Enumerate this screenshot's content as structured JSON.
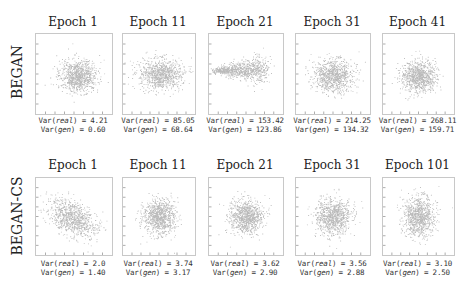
{
  "chart_data": {
    "type": "scatter",
    "title": "",
    "grid": false,
    "rows": [
      {
        "label": "BEGAN",
        "panels": [
          {
            "title": "Epoch 1",
            "var_real": "4.21",
            "var_gen": "0.60",
            "cloud": {
              "cx": 0.55,
              "cy": 0.52,
              "rx": 0.25,
              "ry": 0.2,
              "shape": "blob"
            }
          },
          {
            "title": "Epoch 11",
            "var_real": "85.05",
            "var_gen": "68.64",
            "cloud": {
              "cx": 0.52,
              "cy": 0.5,
              "rx": 0.3,
              "ry": 0.19,
              "shape": "blob"
            }
          },
          {
            "title": "Epoch 21",
            "var_real": "153.42",
            "var_gen": "123.86",
            "cloud": {
              "cx": 0.5,
              "cy": 0.46,
              "rx": 0.34,
              "ry": 0.18,
              "shape": "teardrop"
            }
          },
          {
            "title": "Epoch 31",
            "var_real": "214.25",
            "var_gen": "134.32",
            "cloud": {
              "cx": 0.5,
              "cy": 0.52,
              "rx": 0.27,
              "ry": 0.2,
              "shape": "blob"
            }
          },
          {
            "title": "Epoch 41",
            "var_real": "268.11",
            "var_gen": "159.71",
            "cloud": {
              "cx": 0.5,
              "cy": 0.53,
              "rx": 0.25,
              "ry": 0.19,
              "shape": "blob"
            }
          }
        ]
      },
      {
        "label": "BEGAN-CS",
        "panels": [
          {
            "title": "Epoch 1",
            "var_real": "2.0",
            "var_gen": "1.40",
            "cloud": {
              "cx": 0.48,
              "cy": 0.52,
              "rx": 0.3,
              "ry": 0.2,
              "shape": "tilted"
            }
          },
          {
            "title": "Epoch 11",
            "var_real": "3.74",
            "var_gen": "3.17",
            "cloud": {
              "cx": 0.5,
              "cy": 0.5,
              "rx": 0.22,
              "ry": 0.22,
              "shape": "round"
            }
          },
          {
            "title": "Epoch 21",
            "var_real": "3.62",
            "var_gen": "2.90",
            "cloud": {
              "cx": 0.5,
              "cy": 0.5,
              "rx": 0.22,
              "ry": 0.22,
              "shape": "round"
            }
          },
          {
            "title": "Epoch 31",
            "var_real": "3.56",
            "var_gen": "2.88",
            "cloud": {
              "cx": 0.5,
              "cy": 0.5,
              "rx": 0.24,
              "ry": 0.23,
              "shape": "round"
            }
          },
          {
            "title": "Epoch 101",
            "var_real": "3.10",
            "var_gen": "2.50",
            "cloud": {
              "cx": 0.5,
              "cy": 0.5,
              "rx": 0.22,
              "ry": 0.26,
              "shape": "round"
            }
          }
        ]
      }
    ],
    "annotation_format": {
      "real_prefix": "Var(",
      "real_var": "real",
      "gen_var": "gen",
      "suffix": ") = "
    },
    "colors": {
      "points": "#3a3a3a",
      "frame": "#c8c8c8",
      "text": "#222222"
    }
  }
}
